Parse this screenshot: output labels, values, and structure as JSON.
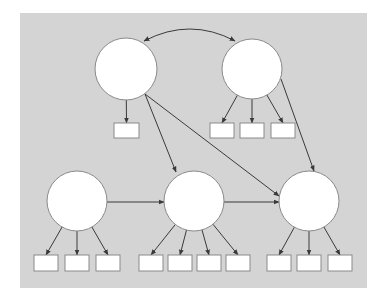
{
  "colors": {
    "page_background": "#ffffff",
    "panel_background": "#d4d4d4",
    "node_fill": "#ffffff",
    "node_stroke": "#8a8a8a",
    "edge_color": "#3a3a3a"
  },
  "panel": {
    "x": 20,
    "y": 13,
    "width": 347,
    "height": 275
  },
  "latent_nodes": [
    {
      "id": "L1",
      "cx": 126,
      "cy": 69,
      "r": 31
    },
    {
      "id": "L2",
      "cx": 252,
      "cy": 69,
      "r": 30
    },
    {
      "id": "L3",
      "cx": 77,
      "cy": 201,
      "r": 30
    },
    {
      "id": "L4",
      "cx": 194,
      "cy": 201,
      "r": 30
    },
    {
      "id": "L5",
      "cx": 309,
      "cy": 201,
      "r": 30
    }
  ],
  "indicator_boxes": [
    {
      "id": "I1",
      "x": 114,
      "y": 123,
      "w": 25,
      "h": 15,
      "parent": "L1"
    },
    {
      "id": "I2",
      "x": 210,
      "y": 123,
      "w": 24,
      "h": 15,
      "parent": "L2"
    },
    {
      "id": "I3",
      "x": 240,
      "y": 123,
      "w": 24,
      "h": 15,
      "parent": "L2"
    },
    {
      "id": "I4",
      "x": 271,
      "y": 123,
      "w": 24,
      "h": 15,
      "parent": "L2"
    },
    {
      "id": "I5",
      "x": 34,
      "y": 255,
      "w": 24,
      "h": 16,
      "parent": "L3"
    },
    {
      "id": "I6",
      "x": 65,
      "y": 255,
      "w": 24,
      "h": 16,
      "parent": "L3"
    },
    {
      "id": "I7",
      "x": 96,
      "y": 255,
      "w": 24,
      "h": 16,
      "parent": "L3"
    },
    {
      "id": "I8",
      "x": 139,
      "y": 255,
      "w": 24,
      "h": 16,
      "parent": "L4"
    },
    {
      "id": "I9",
      "x": 168,
      "y": 255,
      "w": 24,
      "h": 16,
      "parent": "L4"
    },
    {
      "id": "I10",
      "x": 197,
      "y": 255,
      "w": 24,
      "h": 16,
      "parent": "L4"
    },
    {
      "id": "I11",
      "x": 226,
      "y": 255,
      "w": 24,
      "h": 16,
      "parent": "L4"
    },
    {
      "id": "I12",
      "x": 267,
      "y": 255,
      "w": 24,
      "h": 16,
      "parent": "L5"
    },
    {
      "id": "I13",
      "x": 297,
      "y": 255,
      "w": 24,
      "h": 16,
      "parent": "L5"
    },
    {
      "id": "I14",
      "x": 328,
      "y": 255,
      "w": 24,
      "h": 16,
      "parent": "L5"
    }
  ],
  "structural_paths": [
    {
      "from": "L1",
      "to": "L4",
      "x1": 145,
      "y1": 94,
      "x2": 176,
      "y2": 172
    },
    {
      "from": "L1",
      "to": "L5",
      "x1": 145,
      "y1": 94,
      "x2": 279,
      "y2": 196
    },
    {
      "from": "L2",
      "to": "L5",
      "x1": 281,
      "y1": 79,
      "x2": 314,
      "y2": 171
    },
    {
      "from": "L3",
      "to": "L4",
      "x1": 107,
      "y1": 202,
      "x2": 164,
      "y2": 202
    },
    {
      "from": "L4",
      "to": "L5",
      "x1": 224,
      "y1": 202,
      "x2": 279,
      "y2": 202
    }
  ],
  "covariance": {
    "from": "L1",
    "to": "L2",
    "x1": 144,
    "y1": 41,
    "cx": 190,
    "cy": 17,
    "x2": 235,
    "y2": 41
  }
}
